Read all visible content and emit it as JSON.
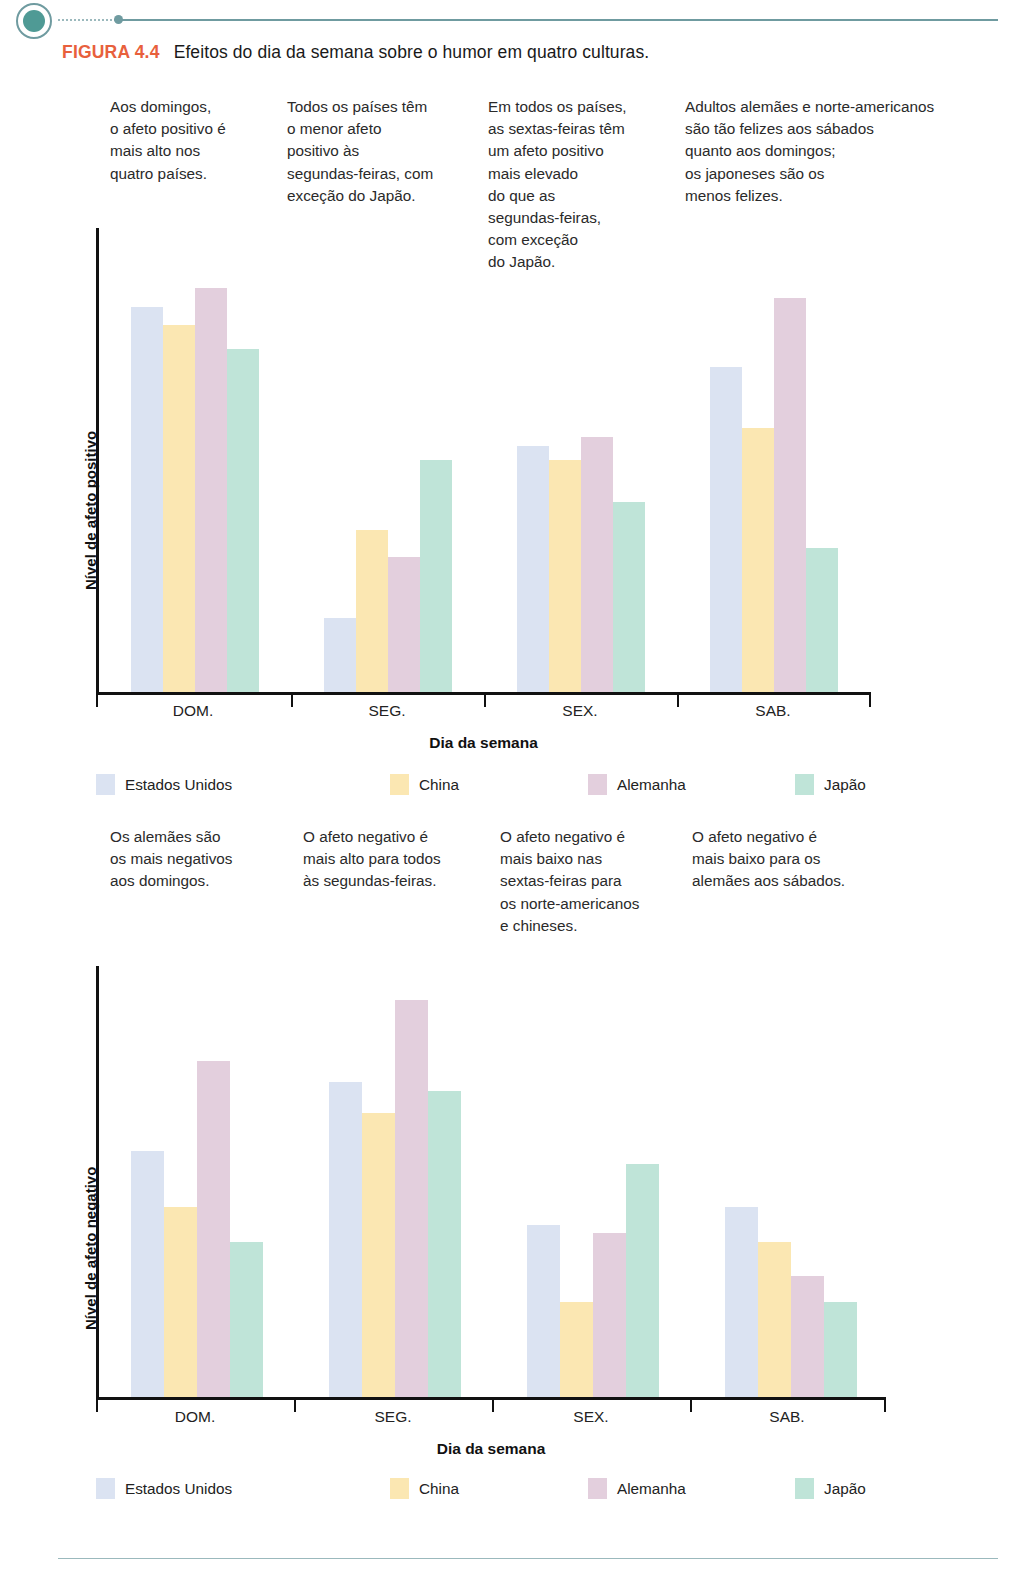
{
  "figure": {
    "number_label": "FIGURA 4.4",
    "number_color": "#e8603c",
    "caption": "Efeitos do dia da semana sobre o humor em quatro culturas."
  },
  "series_colors": {
    "Estados Unidos": "#dbe3f2",
    "China": "#fbe7b2",
    "Alemanha": "#e3cfdd",
    "Japão": "#bfe4d8"
  },
  "top_notes": [
    {
      "id": "note-dom-positive",
      "text": "Aos domingos,\no afeto positivo é\nmais alto nos\nquatro países."
    },
    {
      "id": "note-seg-positive",
      "text": "Todos os países têm\no menor afeto\npositivo às\nsegundas-feiras, com\nexceção do Japão."
    },
    {
      "id": "note-sex-positive",
      "text": "Em todos os países,\nas sextas-feiras têm\num afeto positivo\nmais elevado\ndo que as\nsegundas-feiras,\ncom exceção\ndo Japão."
    },
    {
      "id": "note-sab-positive",
      "text": "Adultos alemães e norte-americanos\nsão tão felizes aos sábados\nquanto aos domingos;\nos japoneses são os\nmenos felizes."
    }
  ],
  "bottom_notes": [
    {
      "id": "note-dom-negative",
      "text": "Os alemães são\nos mais negativos\naos domingos."
    },
    {
      "id": "note-seg-negative",
      "text": "O afeto negativo é\nmais alto para todos\nàs segundas-feiras."
    },
    {
      "id": "note-sex-negative",
      "text": "O afeto negativo é\nmais baixo nas\nsextas-feiras para\nos norte-americanos\ne chineses."
    },
    {
      "id": "note-sab-negative",
      "text": "O afeto negativo é\nmais baixo para os\nalemães aos sábados."
    }
  ],
  "legend": {
    "items": [
      {
        "label": "Estados Unidos",
        "color": "#dbe3f2"
      },
      {
        "label": "China",
        "color": "#fbe7b2"
      },
      {
        "label": "Alemanha",
        "color": "#e3cfdd"
      },
      {
        "label": "Japão",
        "color": "#bfe4d8"
      }
    ]
  },
  "chart_data": [
    {
      "id": "chart-positive-affect",
      "type": "bar",
      "title": "",
      "xlabel": "Dia da semana",
      "ylabel": "Nível de afeto positivo",
      "categories": [
        "DOM.",
        "SEG.",
        "SEX.",
        "SAB."
      ],
      "ylim": [
        0,
        100
      ],
      "grid": false,
      "legend_position": "bottom",
      "series": [
        {
          "name": "Estados Unidos",
          "color": "#dbe3f2",
          "values": [
            83,
            16,
            53,
            70
          ]
        },
        {
          "name": "China",
          "color": "#fbe7b2",
          "values": [
            79,
            35,
            50,
            57
          ]
        },
        {
          "name": "Alemanha",
          "color": "#e3cfdd",
          "values": [
            87,
            29,
            55,
            85
          ]
        },
        {
          "name": "Japão",
          "color": "#bfe4d8",
          "values": [
            74,
            50,
            41,
            31
          ]
        }
      ]
    },
    {
      "id": "chart-negative-affect",
      "type": "bar",
      "title": "",
      "xlabel": "Dia da semana",
      "ylabel": "Nível de afeto negativo",
      "categories": [
        "DOM.",
        "SEG.",
        "SEX.",
        "SAB."
      ],
      "ylim": [
        0,
        100
      ],
      "grid": false,
      "legend_position": "bottom",
      "series": [
        {
          "name": "Estados Unidos",
          "color": "#dbe3f2",
          "values": [
            57,
            73,
            40,
            44
          ]
        },
        {
          "name": "China",
          "color": "#fbe7b2",
          "values": [
            44,
            66,
            22,
            36
          ]
        },
        {
          "name": "Alemanha",
          "color": "#e3cfdd",
          "values": [
            78,
            92,
            38,
            28
          ]
        },
        {
          "name": "Japão",
          "color": "#bfe4d8",
          "values": [
            36,
            71,
            54,
            22
          ]
        }
      ]
    }
  ]
}
